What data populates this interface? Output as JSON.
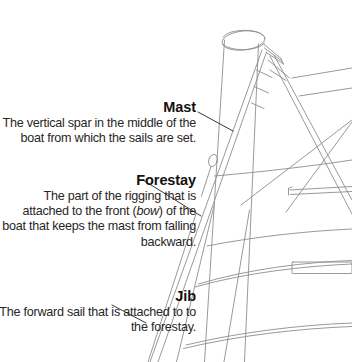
{
  "diagram": {
    "background_color": "#ffffff",
    "line_color": "#8d8d8d",
    "text_color": "#201d1c"
  },
  "callouts": [
    {
      "id": "mast",
      "title": "Mast",
      "body": "The vertical spar in the middle of the boat from which the sails are set."
    },
    {
      "id": "forestay",
      "title": "Forestay",
      "body_part_1": "The part of the rigging that is attached to the front (",
      "body_italic": "bow",
      "body_part_2": ") of the boat that keeps the mast from falling backward."
    },
    {
      "id": "jib",
      "title": "Jib",
      "body": "The forward sail that is attached to to the forestay."
    }
  ]
}
